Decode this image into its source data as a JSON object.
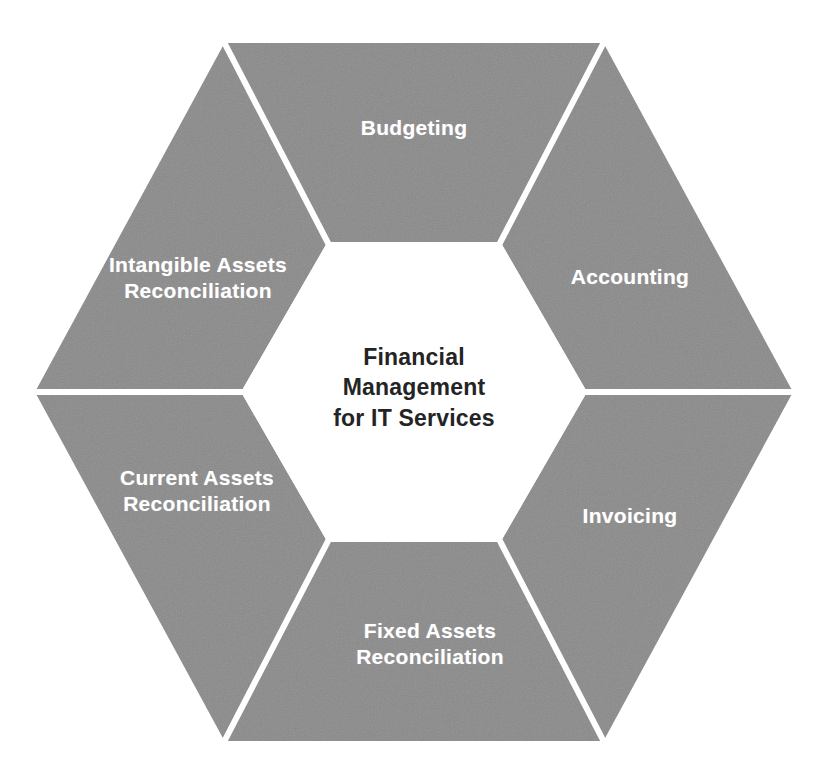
{
  "diagram": {
    "type": "hexagon-wheel",
    "title": "Financial Management for IT Services",
    "center": {
      "text": "Financial\nManagement\nfor IT Services",
      "text_color": "#242424"
    },
    "colors": {
      "segment_fill": "#8a8a8a",
      "divider": "#ffffff",
      "segment_text": "#ffffff",
      "background": "#ffffff"
    },
    "segments": [
      {
        "id": "budgeting",
        "label": "Budgeting",
        "position": "top",
        "label_x": 414,
        "label_y": 128
      },
      {
        "id": "accounting",
        "label": "Accounting",
        "position": "upper-right",
        "label_x": 630,
        "label_y": 277
      },
      {
        "id": "invoicing",
        "label": "Invoicing",
        "position": "lower-right",
        "label_x": 630,
        "label_y": 516
      },
      {
        "id": "fixed-assets-reconciliation",
        "label": "Fixed Assets\nReconciliation",
        "position": "bottom",
        "label_x": 430,
        "label_y": 644
      },
      {
        "id": "current-assets-reconciliation",
        "label": "Current Assets\nReconciliation",
        "position": "lower-left",
        "label_x": 197,
        "label_y": 491
      },
      {
        "id": "intangible-assets-reconciliation",
        "label": "Intangible Assets\nReconciliation",
        "position": "upper-left",
        "label_x": 198,
        "label_y": 278
      }
    ]
  }
}
